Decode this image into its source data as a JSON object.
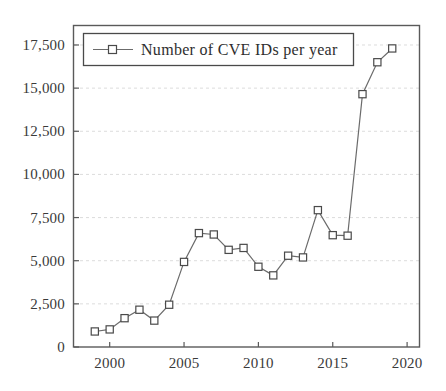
{
  "chart_data": {
    "type": "line",
    "title": "",
    "xlabel": "",
    "ylabel": "",
    "grid": true,
    "legend_position": "top-left-inside",
    "legend": [
      "Number of CVE IDs per year"
    ],
    "series": [
      {
        "name": "Number of CVE IDs per year",
        "marker": "square",
        "x": [
          1999,
          2000,
          2001,
          2002,
          2003,
          2004,
          2005,
          2006,
          2007,
          2008,
          2009,
          2010,
          2011,
          2012,
          2013,
          2014,
          2015,
          2016,
          2017,
          2018,
          2019
        ],
        "values": [
          900,
          1020,
          1670,
          2160,
          1530,
          2450,
          4930,
          6600,
          6520,
          5630,
          5740,
          4650,
          4150,
          5290,
          5190,
          7930,
          6480,
          6450,
          14650,
          16500,
          17300
        ]
      }
    ],
    "x": [
      1999,
      2000,
      2001,
      2002,
      2003,
      2004,
      2005,
      2006,
      2007,
      2008,
      2009,
      2010,
      2011,
      2012,
      2013,
      2014,
      2015,
      2016,
      2017,
      2018,
      2019
    ],
    "xlim": [
      1997.6,
      2020.8
    ],
    "ylim": [
      0,
      18600
    ],
    "xticks": [
      2000,
      2005,
      2010,
      2015,
      2020
    ],
    "xtick_labels": [
      "2000",
      "2005",
      "2010",
      "2015",
      "2020"
    ],
    "yticks": [
      0,
      2500,
      5000,
      7500,
      10000,
      12500,
      15000,
      17500
    ],
    "ytick_labels": [
      "0",
      "2,500",
      "5,000",
      "7,500",
      "10,000",
      "12,500",
      "15,000",
      "17,500"
    ],
    "colors": {
      "line": "#6b6b6b",
      "marker_stroke": "#4a4a4a",
      "marker_fill": "#ffffff",
      "grid": "#d8d8d8",
      "axis": "#5a5a5a",
      "background": "#ffffff"
    }
  }
}
